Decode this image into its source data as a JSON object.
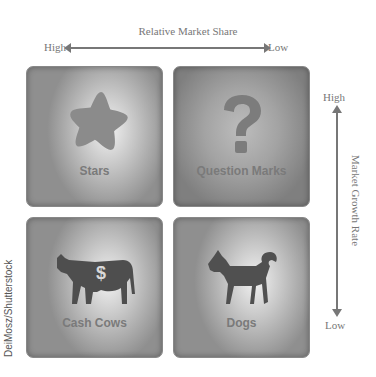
{
  "horizontal_axis": {
    "title": "Relative Market Share",
    "left_label": "High",
    "right_label": "Low"
  },
  "vertical_axis": {
    "title": "Market Growth Rate",
    "top_label": "High",
    "bottom_label": "Low"
  },
  "quadrants": [
    {
      "label": "Stars",
      "icon": "star-icon"
    },
    {
      "label": "Question Marks",
      "icon": "question-mark-icon"
    },
    {
      "label": "Cash Cows",
      "icon": "cow-dollar-icon"
    },
    {
      "label": "Dogs",
      "icon": "dog-icon"
    }
  ],
  "credit": "DeiMosz/Shutterstock"
}
